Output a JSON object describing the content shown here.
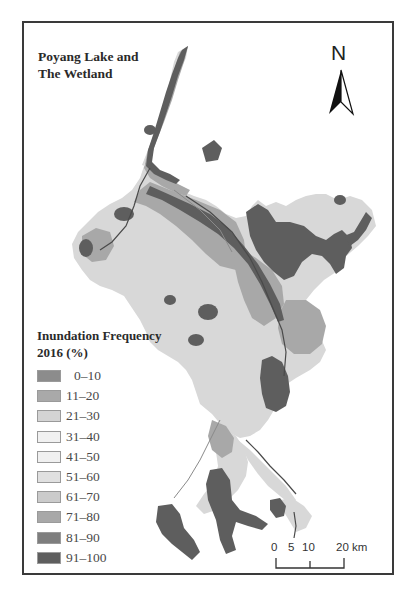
{
  "map": {
    "title_line1": "Poyang Lake and",
    "title_line2": "The Wetland",
    "north_arrow_label": "N",
    "frame_color": "#3a3a3a"
  },
  "legend": {
    "title_line1": "Inundation Frequency",
    "title_line2": "2016 (%)",
    "items": [
      {
        "label": "0–10",
        "color": "#8c8c8c"
      },
      {
        "label": "11–20",
        "color": "#a9a9a9"
      },
      {
        "label": "21–30",
        "color": "#d4d4d4"
      },
      {
        "label": "31–40",
        "color": "#f1f1f1"
      },
      {
        "label": "41–50",
        "color": "#f0f0f0"
      },
      {
        "label": "51–60",
        "color": "#e0e0e0"
      },
      {
        "label": "61–70",
        "color": "#cbcbcb"
      },
      {
        "label": "71–80",
        "color": "#a8a8a8"
      },
      {
        "label": "81–90",
        "color": "#7e7e7e"
      },
      {
        "label": "91–100",
        "color": "#5e5e5e"
      }
    ]
  },
  "scale_bar": {
    "ticks": [
      "0",
      "5",
      "10",
      "20 km"
    ],
    "unit": "km"
  }
}
